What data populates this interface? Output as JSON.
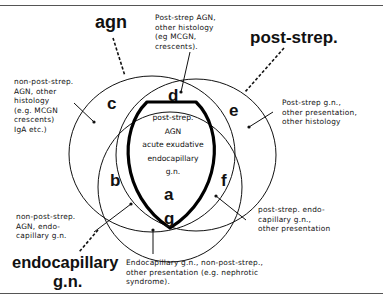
{
  "sets": {
    "agn": {
      "title": "agn"
    },
    "post_strep": {
      "title": "post-strep."
    },
    "endocapillary": {
      "title_line1": "endocapillary",
      "title_line2": "g.n."
    }
  },
  "regions": {
    "a": {
      "letter": "a"
    },
    "b": {
      "letter": "b"
    },
    "c": {
      "letter": "c"
    },
    "d": {
      "letter": "d"
    },
    "e": {
      "letter": "e"
    },
    "f": {
      "letter": "f"
    },
    "g": {
      "letter": "g"
    }
  },
  "center_text": [
    "post-strep.",
    "AGN",
    "acute exudative",
    "endocapillary",
    "g.n."
  ],
  "annotations": {
    "c": "non-post-strep.\nAGN, other\nhistology\n(e.g. MCGN\ncrescents)\nIgA etc.)",
    "d": "Post-strep AGN,\nother histology\n(eg MCGN,\ncrescents).",
    "e": "Post-strep g.n.,\nother presentation,\nother histology",
    "b": "non-post-strep.\nAGN, endo-\ncapillary g.n.",
    "f": "post-strep. endo-\ncapillary g.n.,\nother presentation",
    "g": "Endocapillary g.n., non-post-strep.,\nother presentation (e.g. nephrotic\nsyndrome)."
  }
}
